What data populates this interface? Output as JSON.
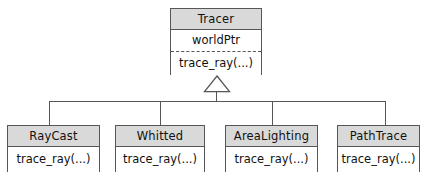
{
  "diagram": {
    "type": "uml-class-diagram",
    "relationship": "generalization",
    "arrow_glyph": "hollow-triangle",
    "colors": {
      "header_fill": "#d9d9d9",
      "body_fill": "#ffffff",
      "stroke": "#565656",
      "text": "#111111",
      "background": "#ffffff"
    },
    "base_class": {
      "name": "Tracer",
      "attributes": [
        "worldPtr"
      ],
      "operations": [
        "trace_ray(...)"
      ],
      "attribute_label": "worldPtr",
      "operation_label": "trace_ray(...)"
    },
    "subclasses": [
      {
        "name": "RayCast",
        "operation_label": "trace_ray(...)"
      },
      {
        "name": "Whitted",
        "operation_label": "trace_ray(...)"
      },
      {
        "name": "AreaLighting",
        "operation_label": "trace_ray(...)"
      },
      {
        "name": "PathTrace",
        "operation_label": "trace_ray(...)"
      }
    ]
  }
}
